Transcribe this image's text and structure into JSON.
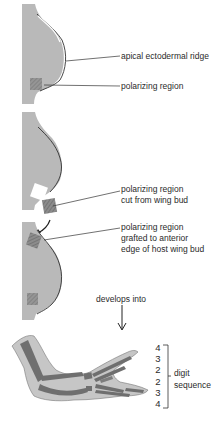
{
  "figure": {
    "panels": [
      {
        "id": "normal-wing-bud",
        "labels": [
          "apical ectodermal ridge",
          "polarizing region"
        ]
      },
      {
        "id": "donor-wing-bud",
        "labels": [
          "polarizing region",
          "cut from wing bud"
        ]
      },
      {
        "id": "host-wing-bud",
        "labels": [
          "polarizing region",
          "grafted to anterior",
          "edge of host wing bud"
        ]
      }
    ],
    "develops_label": "develops into",
    "digit_sequence": {
      "digits": [
        "4",
        "3",
        "2",
        "2",
        "3",
        "4"
      ],
      "label_line1": "digit",
      "label_line2": "sequence"
    },
    "colors": {
      "tissue": "#b9b9b9",
      "bone": "#6f6f6f",
      "polarizing": "#8a8a8a",
      "line": "#333333"
    }
  }
}
